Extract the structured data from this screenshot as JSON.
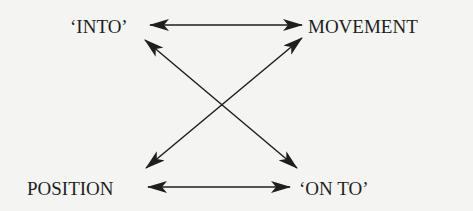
{
  "diagram": {
    "nodes": {
      "into": "‘INTO’",
      "movement": "MOVEMENT",
      "position": "POSITION",
      "onto": "‘ON TO’"
    },
    "edges": [
      {
        "from": "‘INTO’",
        "to": "MOVEMENT",
        "type": "bidirectional"
      },
      {
        "from": "POSITION",
        "to": "‘ON TO’",
        "type": "bidirectional"
      },
      {
        "from": "‘INTO’",
        "to": "‘ON TO’",
        "type": "bidirectional"
      },
      {
        "from": "MOVEMENT",
        "to": "POSITION",
        "type": "bidirectional"
      }
    ],
    "colors": {
      "background": "#f4f4f2",
      "ink": "#1e1e1e"
    }
  }
}
